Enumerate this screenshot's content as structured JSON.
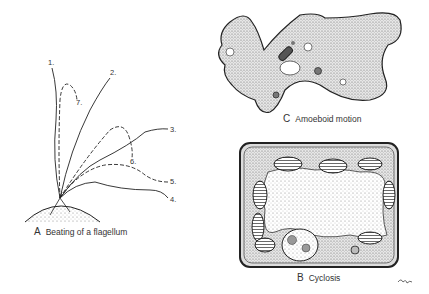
{
  "panels": {
    "A": {
      "letter": "A",
      "caption": "Beating of a flagellum",
      "positions": [
        "1.",
        "2.",
        "3.",
        "4.",
        "5.",
        "6.",
        "7."
      ]
    },
    "B": {
      "letter": "B",
      "caption": "Cyclosis"
    },
    "C": {
      "letter": "C",
      "caption": "Amoeboid motion"
    }
  },
  "signature": "signature-mark"
}
